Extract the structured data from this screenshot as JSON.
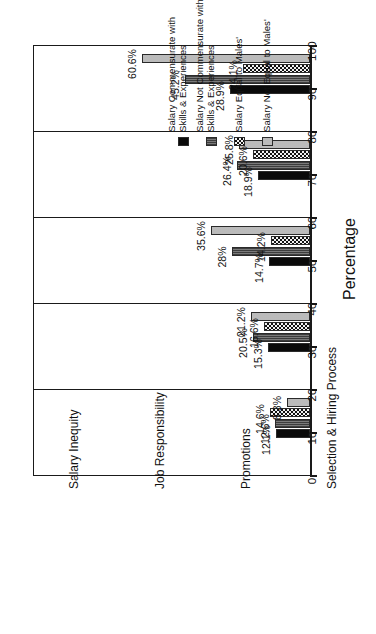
{
  "chart_data": {
    "type": "bar",
    "title": "",
    "subtitle": "",
    "orientation": "horizontal",
    "xlabel": "",
    "ylabel": "Percentage",
    "axis_title": "Percentage",
    "ylim": [
      0,
      100
    ],
    "axis_min": 0,
    "axis_max": 100,
    "tick_step": 10,
    "grid": false,
    "legend_position": "top-center",
    "tick_labels": [
      "0",
      "10",
      "20",
      "30",
      "40",
      "50",
      "60",
      "70",
      "80",
      "90",
      "100"
    ],
    "categories": [
      "Salary Inequity",
      "Job Responsibility",
      "Promotions",
      "Selection & Hiring Process",
      "Other"
    ],
    "series": [
      {
        "name": "Salary Commensurate with Skills & Experiences",
        "name_line1": "Salary Commensurate with",
        "name_line2": "Skills & Experiences",
        "pattern": "solid-black",
        "color": "#0a0a0a",
        "values": [
          28.9,
          18.9,
          14.7,
          15.3,
          12.1
        ],
        "labels": [
          "28.9%",
          "18.9%",
          "14.7%",
          "15.3%",
          "12.1%"
        ]
      },
      {
        "name": "Salary Not Commensurate with Skills & Experiences",
        "name_line1": "Salary Not Commensurate with",
        "name_line2": "Skills & Experiences",
        "pattern": "dark-dense",
        "color": "#555555",
        "values": [
          45.2,
          26.4,
          28.0,
          20.5,
          12.6
        ],
        "labels": [
          "45.2%",
          "26.4%",
          "28%",
          "20.5%",
          "12.6%"
        ]
      },
      {
        "name": "Salary Equal to Males'",
        "name_line1": "Salary Equal to Males'",
        "name_line2": "",
        "pattern": "checker",
        "color": "#111111",
        "values": [
          24.1,
          20.6,
          14.2,
          16.6,
          14.6
        ],
        "labels": [
          "24.1%",
          "20.6%",
          "14.2%",
          "16.6%",
          "14.6%"
        ]
      },
      {
        "name": "Salary Not Equal to Males'",
        "name_line1": "Salary Not Equal to Males'",
        "name_line2": "",
        "pattern": "light-dot",
        "color": "#e4e4e4",
        "values": [
          60.6,
          25.8,
          35.6,
          21.2,
          8.3
        ],
        "labels": [
          "60.6%",
          "25.8%",
          "35.6%",
          "21.2%",
          "8.3%"
        ]
      }
    ]
  }
}
